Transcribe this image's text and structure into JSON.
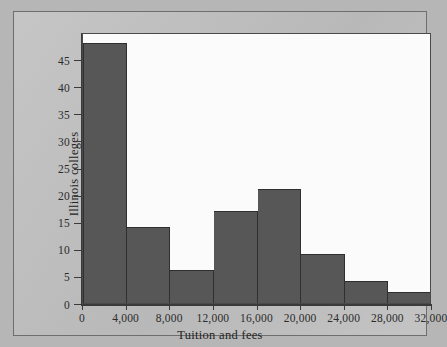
{
  "chart_data": {
    "type": "bar",
    "title": "",
    "subtitle": "",
    "xlabel": "Tuition and fees",
    "ylabel": "Illinois colleges",
    "categories": [
      "0-4,000",
      "4,000-8,000",
      "8,000-12,000",
      "12,000-16,000",
      "16,000-20,000",
      "20,000-24,000",
      "24,000-28,000",
      "28,000-32,000"
    ],
    "bin_edges": [
      0,
      4000,
      8000,
      12000,
      16000,
      20000,
      24000,
      28000,
      32000
    ],
    "values": [
      48,
      14,
      6,
      17,
      21,
      9,
      4,
      2
    ],
    "xlim": [
      0,
      32000
    ],
    "ylim": [
      0,
      50
    ],
    "x_tick_labels": [
      "0",
      "4,000",
      "8,000",
      "12,000",
      "16,000",
      "20,000",
      "24,000",
      "28,000",
      "32,000"
    ],
    "x_tick_values": [
      0,
      4000,
      8000,
      12000,
      16000,
      20000,
      24000,
      28000,
      32000
    ],
    "y_tick_labels": [
      "0",
      "5",
      "10",
      "15",
      "20",
      "25",
      "30",
      "35",
      "40",
      "45"
    ],
    "y_tick_values": [
      0,
      5,
      10,
      15,
      20,
      25,
      30,
      35,
      40,
      45
    ],
    "grid": false,
    "legend": null,
    "bar_color": "#575757",
    "bar_edge_color": "#2f2f2f",
    "plot_background": "#fbfbfb",
    "page_background": "#bfbfbf",
    "axis_color": "#3a3a3a"
  }
}
